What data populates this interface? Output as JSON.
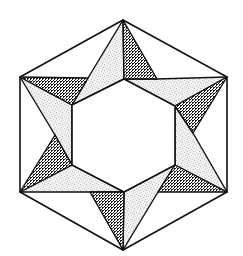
{
  "diagram": {
    "title": "",
    "colors": {
      "background": "#ffffff",
      "stroke": "#111111",
      "dark_fill": "#1a1a1a",
      "dark_bg": "#ffffff",
      "light_fill": "#d9d9d9",
      "light_bg": "#f2f2f2"
    },
    "outer_hexagon": [
      [
        123,
        20
      ],
      [
        227,
        77
      ],
      [
        227,
        192
      ],
      [
        123,
        250
      ],
      [
        20,
        192
      ],
      [
        20,
        77
      ]
    ],
    "inner_hexagon": [
      [
        124,
        79
      ],
      [
        175,
        106
      ],
      [
        175,
        165
      ],
      [
        124,
        192
      ],
      [
        72,
        165
      ],
      [
        72,
        105
      ]
    ],
    "dark_triangles": [
      [
        [
          123,
          20
        ],
        [
          124,
          79
        ],
        [
          157,
          79
        ]
      ],
      [
        [
          227,
          77
        ],
        [
          175,
          106
        ],
        [
          193,
          133
        ]
      ],
      [
        [
          227,
          192
        ],
        [
          175,
          165
        ],
        [
          158,
          192
        ]
      ],
      [
        [
          123,
          250
        ],
        [
          124,
          192
        ],
        [
          90,
          192
        ]
      ],
      [
        [
          20,
          192
        ],
        [
          72,
          165
        ],
        [
          55,
          135
        ]
      ],
      [
        [
          20,
          77
        ],
        [
          72,
          105
        ],
        [
          88,
          78
        ]
      ]
    ],
    "light_regions": [
      [
        [
          123,
          20
        ],
        [
          88,
          78
        ],
        [
          72,
          105
        ],
        [
          124,
          79
        ]
      ],
      [
        [
          227,
          77
        ],
        [
          157,
          79
        ],
        [
          124,
          79
        ],
        [
          175,
          106
        ]
      ],
      [
        [
          227,
          192
        ],
        [
          193,
          133
        ],
        [
          175,
          106
        ],
        [
          175,
          165
        ]
      ],
      [
        [
          123,
          250
        ],
        [
          158,
          192
        ],
        [
          175,
          165
        ],
        [
          124,
          192
        ]
      ],
      [
        [
          20,
          192
        ],
        [
          90,
          192
        ],
        [
          124,
          192
        ],
        [
          72,
          165
        ]
      ],
      [
        [
          20,
          77
        ],
        [
          55,
          135
        ],
        [
          72,
          165
        ],
        [
          72,
          105
        ]
      ]
    ]
  }
}
